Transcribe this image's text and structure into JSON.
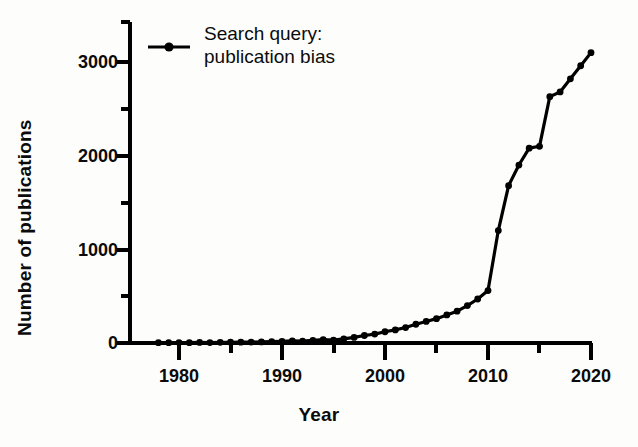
{
  "chart_data": {
    "type": "line",
    "title": "",
    "subtitle": "",
    "xlabel": "Year",
    "ylabel": "Number of publications",
    "xlim": [
      1975,
      2021
    ],
    "ylim": [
      0,
      3250
    ],
    "grid": false,
    "legend_position": "top-left inside",
    "series": [
      {
        "name": "Search query: publication bias",
        "marker": "filled-circle",
        "color": "#000000",
        "x": [
          1978,
          1979,
          1980,
          1981,
          1982,
          1983,
          1984,
          1985,
          1986,
          1987,
          1988,
          1989,
          1990,
          1991,
          1992,
          1993,
          1994,
          1995,
          1996,
          1997,
          1998,
          1999,
          2000,
          2001,
          2002,
          2003,
          2004,
          2005,
          2006,
          2007,
          2008,
          2009,
          2010,
          2011,
          2012,
          2013,
          2014,
          2015,
          2016,
          2017,
          2018,
          2019,
          2020
        ],
        "y": [
          3,
          4,
          5,
          4,
          6,
          5,
          7,
          8,
          9,
          10,
          12,
          14,
          18,
          22,
          20,
          28,
          35,
          30,
          45,
          60,
          80,
          95,
          120,
          140,
          165,
          200,
          230,
          260,
          300,
          340,
          400,
          470,
          560,
          1200,
          1680,
          1900,
          2080,
          2100,
          2630,
          2680,
          2820,
          2960,
          3100
        ]
      }
    ],
    "x_ticks_major": [
      1980,
      1990,
      2000,
      2010,
      2020
    ],
    "x_ticks_minor": [
      1985,
      1995,
      2005,
      2015
    ],
    "y_ticks_major": [
      0,
      1000,
      2000,
      3000
    ],
    "y_ticks_minor": [
      500,
      1500,
      2500,
      3250
    ]
  },
  "legend": {
    "line1": "Search query:",
    "line2": "publication bias",
    "marker_symbol": "line-with-dot-marker"
  },
  "axes": {
    "x_title": "Year",
    "y_title": "Number of publications",
    "x_tick_labels": [
      "1980",
      "1990",
      "2000",
      "2010",
      "2020"
    ],
    "y_tick_labels": [
      "0",
      "1000",
      "2000",
      "3000"
    ]
  },
  "colors": {
    "line": "#000000",
    "axis": "#000000",
    "background": "#fdfdfc",
    "text": "#0b0b0b"
  }
}
